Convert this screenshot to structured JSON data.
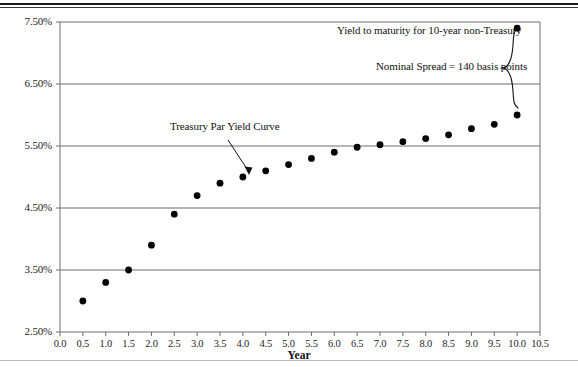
{
  "figure": {
    "axis_x_title": "Year",
    "annotations": {
      "curve_label": "Treasury Par Yield Curve",
      "ytm_label": "Yield to maturity for 10-year non-Treasury",
      "spread_label": "Nominal Spread = 140 basis points"
    },
    "colors": {
      "marker": "#000000",
      "gridline": "#6e6e6e",
      "axis": "#6e6e6e",
      "text": "#111111",
      "rule": "#1a1a1a"
    }
  },
  "chart_data": {
    "type": "scatter",
    "title": "",
    "subtitle": "",
    "xlabel": "Year",
    "ylabel": "",
    "xlim": [
      0.0,
      10.5
    ],
    "ylim": [
      2.5,
      7.5
    ],
    "grid": true,
    "legend_position": "none",
    "x_tick_labels": [
      "0.0",
      "0.5",
      "1.0",
      "1.5",
      "2.0",
      "2.5",
      "3.0",
      "3.5",
      "4.0",
      "4.5",
      "5.0",
      "5.5",
      "6.0",
      "6.5",
      "7.0",
      "7.5",
      "8.0",
      "8.5",
      "9.0",
      "9.5",
      "10.0",
      "10.5"
    ],
    "x_ticks": [
      0.0,
      0.5,
      1.0,
      1.5,
      2.0,
      2.5,
      3.0,
      3.5,
      4.0,
      4.5,
      5.0,
      5.5,
      6.0,
      6.5,
      7.0,
      7.5,
      8.0,
      8.5,
      9.0,
      9.5,
      10.0,
      10.5
    ],
    "y_tick_labels": [
      "2.50%",
      "3.50%",
      "4.50%",
      "5.50%",
      "6.50%",
      "7.50%"
    ],
    "y_ticks": [
      2.5,
      3.5,
      4.5,
      5.5,
      6.5,
      7.5
    ],
    "series": [
      {
        "name": "Treasury Par Yield Curve",
        "x": [
          0.5,
          1.0,
          1.5,
          2.0,
          2.5,
          3.0,
          3.5,
          4.0,
          4.5,
          5.0,
          5.5,
          6.0,
          6.5,
          7.0,
          7.5,
          8.0,
          8.5,
          9.0,
          9.5,
          10.0
        ],
        "values": [
          3.0,
          3.3,
          3.5,
          3.9,
          4.4,
          4.7,
          4.9,
          5.0,
          5.1,
          5.2,
          5.3,
          5.4,
          5.48,
          5.52,
          5.57,
          5.62,
          5.68,
          5.78,
          5.85,
          6.0
        ]
      },
      {
        "name": "10-year non-Treasury",
        "x": [
          10.0
        ],
        "values": [
          7.4
        ]
      }
    ],
    "spread_basis_points": 140
  }
}
